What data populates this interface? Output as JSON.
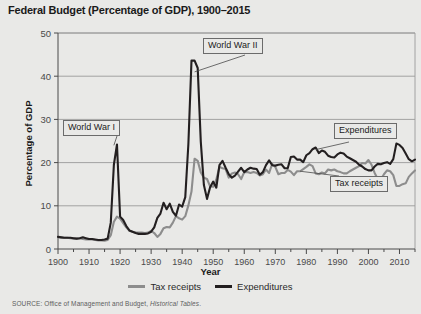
{
  "chart_data": {
    "type": "line",
    "title": "Federal Budget (Percentage of GDP), 1900–2015",
    "xlabel": "Year",
    "ylabel": "Percentage of GDP",
    "xlim": [
      1900,
      2015
    ],
    "ylim": [
      0,
      50
    ],
    "yticks": [
      0,
      10,
      20,
      30,
      40,
      50
    ],
    "ytick_labels": [
      "0",
      "10",
      "20",
      "30",
      "40",
      "50"
    ],
    "xticks": [
      1900,
      1910,
      1920,
      1930,
      1940,
      1950,
      1960,
      1970,
      1980,
      1990,
      2000,
      2010
    ],
    "xtick_labels": [
      "1900",
      "1910",
      "1920",
      "1930",
      "1940",
      "1950",
      "1960",
      "1970",
      "1980",
      "1990",
      "2000",
      "2010"
    ],
    "x_minor_tick_interval": 5,
    "grid": "horizontal",
    "legend_position": "below-plot",
    "colors": {
      "tax_receipts": "#8d8d8d",
      "expenditures": "#231f20",
      "background": "#e9e9e7",
      "grid": "#9a9a9a",
      "axis": "#4a4a4a"
    },
    "annotations": [
      {
        "label": "World War I",
        "points_to_year": 1918,
        "points_to_value": 24
      },
      {
        "label": "World War II",
        "points_to_year": 1944,
        "points_to_value": 41
      },
      {
        "label": "Expenditures",
        "points_to_year": 1983,
        "points_to_value": 23
      },
      {
        "label": "Tax receipts",
        "points_to_year": 1978,
        "points_to_value": 18
      }
    ],
    "x": [
      1900,
      1901,
      1902,
      1903,
      1904,
      1905,
      1906,
      1907,
      1908,
      1909,
      1910,
      1911,
      1912,
      1913,
      1914,
      1915,
      1916,
      1917,
      1918,
      1919,
      1920,
      1921,
      1922,
      1923,
      1924,
      1925,
      1926,
      1927,
      1928,
      1929,
      1930,
      1931,
      1932,
      1933,
      1934,
      1935,
      1936,
      1937,
      1938,
      1939,
      1940,
      1941,
      1942,
      1943,
      1944,
      1945,
      1946,
      1947,
      1948,
      1949,
      1950,
      1951,
      1952,
      1953,
      1954,
      1955,
      1956,
      1957,
      1958,
      1959,
      1960,
      1961,
      1962,
      1963,
      1964,
      1965,
      1966,
      1967,
      1968,
      1969,
      1970,
      1971,
      1972,
      1973,
      1974,
      1975,
      1976,
      1977,
      1978,
      1979,
      1980,
      1981,
      1982,
      1983,
      1984,
      1985,
      1986,
      1987,
      1988,
      1989,
      1990,
      1991,
      1992,
      1993,
      1994,
      1995,
      1996,
      1997,
      1998,
      1999,
      2000,
      2001,
      2002,
      2003,
      2004,
      2005,
      2006,
      2007,
      2008,
      2009,
      2010,
      2011,
      2012,
      2013,
      2014,
      2015
    ],
    "series": [
      {
        "name": "Tax receipts",
        "color": "#8d8d8d",
        "values": [
          2.8,
          2.7,
          2.6,
          2.6,
          2.5,
          2.4,
          2.4,
          2.5,
          2.3,
          2.2,
          2.2,
          2.2,
          2.1,
          2.0,
          2.0,
          1.9,
          2.1,
          3.2,
          6.3,
          7.5,
          7.0,
          6.0,
          5.0,
          4.2,
          4.0,
          3.8,
          3.8,
          3.8,
          3.7,
          3.8,
          4.2,
          3.7,
          2.8,
          3.5,
          4.8,
          5.1,
          5.0,
          6.1,
          7.6,
          7.1,
          6.8,
          7.6,
          10.1,
          13.3,
          20.9,
          20.4,
          17.7,
          16.5,
          16.2,
          14.5,
          14.4,
          16.1,
          19.0,
          18.7,
          18.5,
          16.5,
          17.5,
          17.7,
          17.3,
          16.2,
          17.8,
          17.8,
          17.6,
          17.8,
          17.6,
          17.0,
          17.3,
          18.4,
          17.6,
          19.7,
          19.0,
          17.3,
          17.6,
          17.6,
          18.3,
          17.9,
          17.1,
          18.0,
          18.0,
          18.5,
          19.0,
          19.6,
          19.2,
          17.5,
          17.3,
          17.7,
          17.5,
          18.4,
          18.2,
          18.4,
          18.0,
          17.8,
          17.5,
          17.5,
          18.0,
          18.4,
          18.8,
          19.2,
          19.9,
          19.8,
          20.6,
          19.5,
          17.6,
          16.2,
          16.1,
          17.3,
          18.2,
          18.0,
          17.1,
          14.6,
          14.6,
          15.0,
          15.2,
          16.7,
          17.5,
          18.2
        ]
      },
      {
        "name": "Expenditures",
        "color": "#231f20",
        "values": [
          2.8,
          2.7,
          2.6,
          2.6,
          2.6,
          2.5,
          2.4,
          2.5,
          2.7,
          2.5,
          2.3,
          2.3,
          2.2,
          2.1,
          2.1,
          2.2,
          2.4,
          6.1,
          19.5,
          24.2,
          7.5,
          6.7,
          5.3,
          4.3,
          4.0,
          3.7,
          3.5,
          3.5,
          3.5,
          3.6,
          4.0,
          5.0,
          7.2,
          8.2,
          10.7,
          9.2,
          10.5,
          8.6,
          7.7,
          10.3,
          9.8,
          12.0,
          24.3,
          43.6,
          43.6,
          41.9,
          24.8,
          14.8,
          11.6,
          14.3,
          15.6,
          14.2,
          19.4,
          20.4,
          18.8,
          17.3,
          16.5,
          17.0,
          17.9,
          18.8,
          17.8,
          18.4,
          18.8,
          18.6,
          18.5,
          17.2,
          17.8,
          19.4,
          20.5,
          19.4,
          19.3,
          19.5,
          19.6,
          18.7,
          18.7,
          21.3,
          21.4,
          20.7,
          20.7,
          20.1,
          21.7,
          22.2,
          23.1,
          23.5,
          22.2,
          22.8,
          22.5,
          21.6,
          21.3,
          21.2,
          21.9,
          22.3,
          22.1,
          21.4,
          21.0,
          20.6,
          20.2,
          19.5,
          19.1,
          18.5,
          18.2,
          18.2,
          19.1,
          19.7,
          19.6,
          19.9,
          20.1,
          19.7,
          20.8,
          24.4,
          24.1,
          23.4,
          22.1,
          20.8,
          20.3,
          20.7
        ]
      }
    ]
  },
  "legend": {
    "items": [
      {
        "label": "Tax receipts",
        "style": "tax"
      },
      {
        "label": "Expenditures",
        "style": "exp"
      }
    ]
  },
  "source": {
    "prefix": "SOURCE: Office of Management and Budget, ",
    "italic": "Historical Tables",
    "suffix": "."
  }
}
